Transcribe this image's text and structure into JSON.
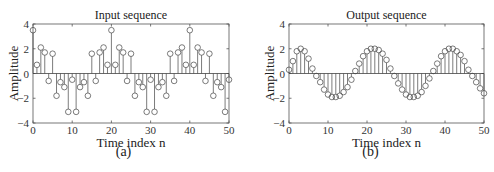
{
  "chart_data": [
    {
      "type": "stem",
      "title": "Input sequence",
      "xlabel": "Time index n",
      "ylabel": "Amplitude",
      "caption": "(a)",
      "xlim": [
        0,
        50
      ],
      "ylim": [
        -4,
        4
      ],
      "xticks": [
        0,
        10,
        20,
        30,
        40,
        50
      ],
      "yticks": [
        -4,
        -2,
        0,
        2,
        4
      ],
      "grid": false,
      "x": [
        0,
        1,
        2,
        3,
        4,
        5,
        6,
        7,
        8,
        9,
        10,
        11,
        12,
        13,
        14,
        15,
        16,
        17,
        18,
        19,
        20,
        21,
        22,
        23,
        24,
        25,
        26,
        27,
        28,
        29,
        30,
        31,
        32,
        33,
        34,
        35,
        36,
        37,
        38,
        39,
        40,
        41,
        42,
        43,
        44,
        45,
        46,
        47,
        48,
        49,
        50
      ],
      "values": [
        3.5,
        0.7,
        2.1,
        1.7,
        -0.6,
        1.6,
        -1.8,
        -0.7,
        -1.1,
        -3.1,
        -0.5,
        -3.1,
        -1.1,
        -0.7,
        -1.8,
        1.6,
        -0.6,
        1.7,
        2.1,
        0.7,
        3.5,
        0.7,
        2.1,
        1.7,
        -0.6,
        1.6,
        -1.8,
        -0.7,
        -1.1,
        -3.1,
        -0.5,
        -3.1,
        -1.1,
        -0.7,
        -1.8,
        1.6,
        -0.6,
        1.7,
        2.1,
        0.7,
        3.5,
        0.7,
        2.1,
        1.7,
        -0.6,
        1.6,
        -1.8,
        -0.7,
        -1.1,
        -3.1,
        -0.5
      ]
    },
    {
      "type": "stem",
      "title": "Output sequence",
      "xlabel": "Time index n",
      "ylabel": "Amplitude",
      "caption": "(b)",
      "xlim": [
        0,
        50
      ],
      "ylim": [
        -4,
        4
      ],
      "xticks": [
        0,
        10,
        20,
        30,
        40,
        50
      ],
      "yticks": [
        -4,
        -2,
        0,
        2,
        4
      ],
      "grid": false,
      "x": [
        0,
        1,
        2,
        3,
        4,
        5,
        6,
        7,
        8,
        9,
        10,
        11,
        12,
        13,
        14,
        15,
        16,
        17,
        18,
        19,
        20,
        21,
        22,
        23,
        24,
        25,
        26,
        27,
        28,
        29,
        30,
        31,
        32,
        33,
        34,
        35,
        36,
        37,
        38,
        39,
        40,
        41,
        42,
        43,
        44,
        45,
        46,
        47,
        48,
        49,
        50
      ],
      "values": [
        0.3,
        1.0,
        1.8,
        2.0,
        1.8,
        1.2,
        0.4,
        -0.2,
        -0.7,
        -1.3,
        -1.7,
        -1.9,
        -1.9,
        -1.8,
        -1.5,
        -1.1,
        -0.5,
        0.2,
        0.8,
        1.4,
        1.8,
        2.0,
        2.0,
        1.9,
        1.6,
        1.1,
        0.4,
        -0.2,
        -0.8,
        -1.3,
        -1.7,
        -1.9,
        -1.9,
        -1.8,
        -1.5,
        -1.0,
        -0.4,
        0.2,
        0.8,
        1.4,
        1.8,
        2.0,
        2.0,
        1.8,
        1.5,
        1.0,
        0.3,
        -0.2,
        -0.7,
        -1.2,
        -1.6
      ]
    }
  ]
}
